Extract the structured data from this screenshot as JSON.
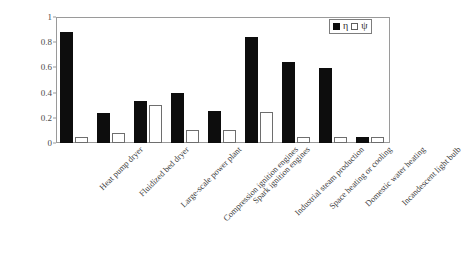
{
  "chart_data": {
    "type": "bar",
    "title": "",
    "subtitle": "",
    "xlabel": "",
    "ylabel": "",
    "ylim": [
      0,
      1
    ],
    "yticks": [
      0,
      0.2,
      0.4,
      0.6,
      0.8,
      1
    ],
    "ytick_labels": [
      "0",
      "0.2",
      "0.4",
      "0.6",
      "0.8",
      "1"
    ],
    "grid": false,
    "legend_position": "top-right",
    "categories": [
      "Heat pump dryer",
      "Fluidized bed dryer",
      "Large-scale power plant",
      "Compression ignition engines",
      "Spark ignition engines",
      "Industrial steam production",
      "Space heating or cooling",
      "Domestic water heating",
      "Incandescent light bulb"
    ],
    "series": [
      {
        "name": "η",
        "style": "filled",
        "color": "#0d0d0d",
        "values": [
          0.88,
          0.235,
          0.33,
          0.4,
          0.255,
          0.845,
          0.645,
          0.595,
          0.05
        ]
      },
      {
        "name": "ψ",
        "style": "open",
        "color": "#ffffff",
        "values": [
          0.05,
          0.08,
          0.3,
          0.1,
          0.1,
          0.25,
          0.045,
          0.045,
          0.05
        ]
      }
    ]
  },
  "legend": {
    "entries": [
      {
        "swatch": "filled-square",
        "label": "η"
      },
      {
        "swatch": "open-square",
        "label": "ψ"
      }
    ]
  },
  "colors": {
    "eta_fill": "#0d0d0d",
    "psi_fill": "#ffffff",
    "psi_stroke": "#6e6e6e",
    "axis": "#9a9a9a",
    "text": "#3a3a3a",
    "background": "#ffffff"
  }
}
